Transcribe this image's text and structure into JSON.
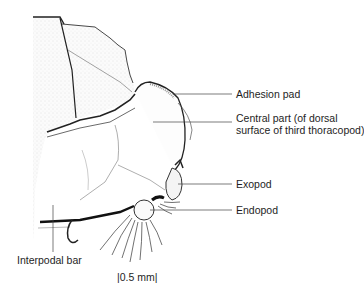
{
  "figure": {
    "labels": [
      {
        "id": "adhesion-pad",
        "text": "Adhesion pad"
      },
      {
        "id": "central-part",
        "text": "Central part (of dorsal\nsurface of third thoracopod)"
      },
      {
        "id": "exopod",
        "text": "Exopod"
      },
      {
        "id": "endopod",
        "text": "Endopod"
      },
      {
        "id": "interpodal-bar",
        "text": "Interpodal bar"
      }
    ],
    "scale_bar": {
      "text": "|0.5 mm|"
    }
  }
}
